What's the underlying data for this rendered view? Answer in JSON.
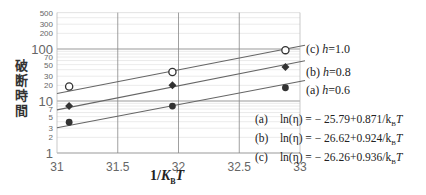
{
  "chart_data": {
    "type": "scatter",
    "title": "",
    "xlabel": "1/K_BT",
    "ylabel": "破断時間",
    "xlim": [
      31,
      33
    ],
    "ylim": [
      1,
      500
    ],
    "yscale": "log",
    "grid": true,
    "x_ticks": [
      "31",
      "31.5",
      "32",
      "32.5",
      "33"
    ],
    "x_tick_values": [
      31,
      31.5,
      32,
      32.5,
      33
    ],
    "y_ticks": [
      "1",
      "2",
      "3",
      "5",
      "7",
      "10",
      "20",
      "30",
      "50",
      "70",
      "100",
      "200",
      "300",
      "500"
    ],
    "y_tick_values": [
      1,
      2,
      3,
      5,
      7,
      10,
      20,
      30,
      50,
      70,
      100,
      200,
      300,
      500
    ],
    "y_major_ticks": [
      1,
      10,
      100
    ],
    "series": [
      {
        "name": "(c) h=1.0",
        "label_prefix": "(c)",
        "label_var": "h",
        "label_value": "=1.0",
        "marker": "open-circle",
        "x": [
          31.1,
          31.95,
          32.88
        ],
        "y": [
          19,
          36,
          95
        ],
        "fit_y": [
          15.5,
          42,
          100
        ]
      },
      {
        "name": "(b) h=0.8",
        "label_prefix": "(b)",
        "label_var": "h",
        "label_value": "=0.8",
        "marker": "diamond",
        "x": [
          31.1,
          31.95,
          32.88
        ],
        "y": [
          8,
          20,
          45
        ],
        "fit_y": [
          7.5,
          18,
          50
        ]
      },
      {
        "name": "(a) h=0.6",
        "label_prefix": "(a)",
        "label_var": "h",
        "label_value": "=0.6",
        "marker": "filled-circle",
        "x": [
          31.1,
          31.95,
          32.88
        ],
        "y": [
          3.9,
          8,
          18
        ],
        "fit_y": [
          3.4,
          7.5,
          21
        ]
      }
    ],
    "equations": [
      {
        "label": "(a)",
        "text": "ln(η) = − 25.79+0.871/k",
        "sub": "B",
        "tail": "T"
      },
      {
        "label": "(b)",
        "text": "ln(η) = − 26.62+0.924/k",
        "sub": "B",
        "tail": "T"
      },
      {
        "label": "(c)",
        "text": "ln(η) = − 26.26+0.936/k",
        "sub": "B",
        "tail": "T"
      }
    ]
  },
  "colors": {
    "line": "#666666",
    "grid_minor": "#dddddd",
    "grid_major": "#999999",
    "marker": "#333333"
  }
}
